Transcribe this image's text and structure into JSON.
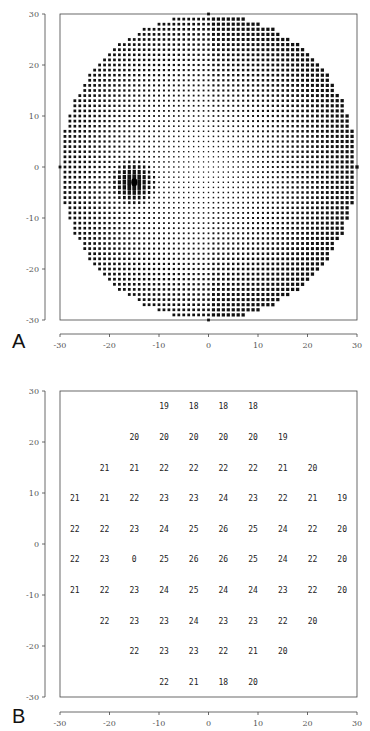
{
  "figure": {
    "panel_a_label": "A",
    "panel_b_label": "B"
  },
  "chart_data": [
    {
      "type": "scatter",
      "panel": "A",
      "title": "",
      "description": "Dense grid of test points (1° spacing) within a 30° radius circle; dot size varies, larger at periphery/right, smallest near center; dark cluster at blind spot near (-15, -3).",
      "xlabel": "",
      "ylabel": "",
      "xlim": [
        -30,
        30
      ],
      "ylim": [
        -30,
        30
      ],
      "x_ticks": [
        -30,
        -20,
        -10,
        0,
        10,
        20,
        30
      ],
      "y_ticks": [
        30,
        20,
        10,
        0,
        -10,
        -20,
        -30
      ],
      "grid_spacing": 1,
      "field_radius": 30,
      "blind_spot": {
        "x": -15,
        "y": -3
      },
      "grid": false
    },
    {
      "type": "table",
      "panel": "B",
      "title": "",
      "xlabel": "",
      "ylabel": "",
      "xlim": [
        -30,
        30
      ],
      "ylim": [
        -30,
        30
      ],
      "x_ticks": [
        -30,
        -20,
        -10,
        0,
        10,
        20,
        30
      ],
      "y_ticks": [
        30,
        20,
        10,
        0,
        -10,
        -20,
        -30
      ],
      "x_positions": [
        -27,
        -21,
        -15,
        -9,
        -3,
        3,
        9,
        15,
        21,
        27
      ],
      "rows": [
        {
          "y": 27,
          "values": [
            null,
            null,
            null,
            19,
            18,
            18,
            18,
            null,
            null,
            null
          ]
        },
        {
          "y": 21,
          "values": [
            null,
            null,
            20,
            20,
            20,
            20,
            20,
            19,
            null,
            null
          ]
        },
        {
          "y": 15,
          "values": [
            null,
            21,
            21,
            22,
            22,
            22,
            22,
            21,
            20,
            null
          ]
        },
        {
          "y": 9,
          "values": [
            21,
            21,
            22,
            23,
            23,
            24,
            23,
            22,
            21,
            19
          ]
        },
        {
          "y": 3,
          "values": [
            22,
            22,
            23,
            24,
            25,
            26,
            25,
            24,
            22,
            20
          ]
        },
        {
          "y": -3,
          "values": [
            22,
            23,
            0,
            25,
            26,
            26,
            25,
            24,
            22,
            20
          ]
        },
        {
          "y": -9,
          "values": [
            21,
            22,
            23,
            24,
            25,
            24,
            24,
            23,
            22,
            20
          ]
        },
        {
          "y": -15,
          "values": [
            null,
            22,
            23,
            23,
            24,
            23,
            23,
            22,
            20,
            null
          ]
        },
        {
          "y": -21,
          "values": [
            null,
            null,
            22,
            23,
            23,
            22,
            21,
            20,
            null,
            null
          ]
        },
        {
          "y": -27,
          "values": [
            null,
            null,
            null,
            22,
            21,
            18,
            20,
            null,
            null,
            null
          ]
        }
      ],
      "grid": false
    }
  ]
}
